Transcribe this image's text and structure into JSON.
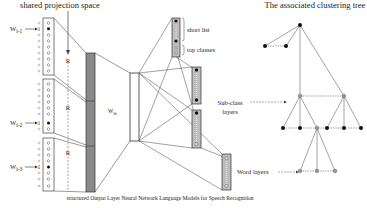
{
  "diagram": {
    "left_title": "shared projection space",
    "right_title": "The associated clustering tree",
    "inputs": [
      {
        "label": "W",
        "sub": "i-1"
      },
      {
        "label": "W",
        "sub": "i-2"
      },
      {
        "label": "W",
        "sub": "i-3"
      }
    ],
    "projection_label": "R",
    "weight_label": "W",
    "weight_sub": "ih",
    "output_labels": {
      "short_list": "short list",
      "top_classes": "top classes",
      "sub_class_1": "Sub-class",
      "sub_class_2": "layers",
      "word_layers": "Word layers"
    },
    "caption": "structured Output Layer Neural Network Language Models for Speech Recognition",
    "colors": {
      "line": "#555555",
      "bar_fill": "#8a8a8a",
      "box_fill": "#bdbdbd",
      "node_black": "#111111",
      "node_gray": "#9a9a9a"
    }
  }
}
